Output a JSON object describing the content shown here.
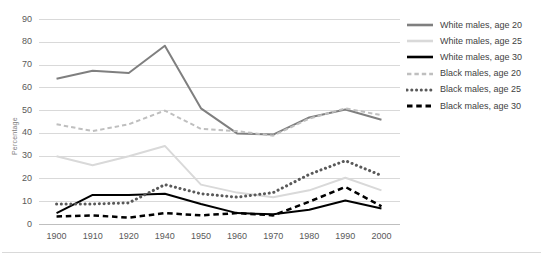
{
  "chart_data": {
    "type": "line",
    "title": "",
    "xlabel": "",
    "ylabel": "Percentage",
    "categories": [
      "1900",
      "1910",
      "1920",
      "1940",
      "1950",
      "1960",
      "1970",
      "1980",
      "1990",
      "2000"
    ],
    "ylim": [
      0,
      90
    ],
    "yticks": [
      "0",
      "10",
      "20",
      "30",
      "40",
      "50",
      "60",
      "70",
      "80",
      "90"
    ],
    "grid": true,
    "legend_position": "right",
    "series": [
      {
        "name": "White males, age 20",
        "color": "#7f7f7f",
        "style": "solid",
        "width": 2,
        "values": [
          64,
          67.5,
          66.5,
          78.5,
          51,
          40,
          39.5,
          47,
          50.5,
          46
        ]
      },
      {
        "name": "White males, age 25",
        "color": "#d9d9d9",
        "style": "solid",
        "width": 2,
        "values": [
          30,
          26,
          30,
          34.5,
          17.5,
          14,
          12,
          15,
          20.5,
          15
        ]
      },
      {
        "name": "White males, age 30",
        "color": "#000000",
        "style": "solid",
        "width": 2,
        "values": [
          5,
          13,
          13,
          13.5,
          9,
          5,
          4.5,
          6.5,
          10.5,
          7
        ]
      },
      {
        "name": "Black males, age 20",
        "color": "#bfbfbf",
        "style": "dashed",
        "width": 2,
        "values": [
          44,
          41,
          44,
          50,
          42,
          41,
          39,
          46.5,
          51,
          48
        ]
      },
      {
        "name": "Black males, age 25",
        "color": "#595959",
        "style": "dotted",
        "width": 3,
        "values": [
          9,
          9,
          9.5,
          17.5,
          13.5,
          12,
          14,
          22,
          28,
          21.5
        ]
      },
      {
        "name": "Black males, age 30",
        "color": "#000000",
        "style": "dashed",
        "width": 2.5,
        "values": [
          3.5,
          4,
          3,
          5,
          4,
          5,
          4,
          10,
          16.5,
          8
        ]
      }
    ]
  }
}
